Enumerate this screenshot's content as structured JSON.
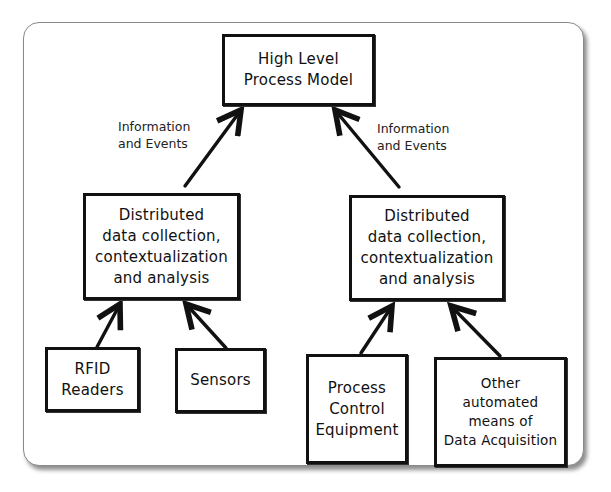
{
  "diagram": {
    "nodes": {
      "top": "High Level\nProcess Model",
      "mid_left": "Distributed\ndata collection,\ncontextualization\nand analysis",
      "mid_right": "Distributed\ndata collection,\ncontextualization\nand analysis",
      "rfid": "RFID\nReaders",
      "sensors": "Sensors",
      "process_control": "Process\nControl\nEquipment",
      "other": "Other\nautomated\nmeans of\nData Acquisition"
    },
    "edge_labels": {
      "left": "Information\nand Events",
      "right": "Information\nand Events"
    },
    "edges": [
      {
        "from": "mid_left",
        "to": "top",
        "label": "Information and Events"
      },
      {
        "from": "mid_right",
        "to": "top",
        "label": "Information and Events"
      },
      {
        "from": "rfid",
        "to": "mid_left"
      },
      {
        "from": "sensors",
        "to": "mid_left"
      },
      {
        "from": "process_control",
        "to": "mid_right"
      },
      {
        "from": "other",
        "to": "mid_right"
      }
    ]
  }
}
